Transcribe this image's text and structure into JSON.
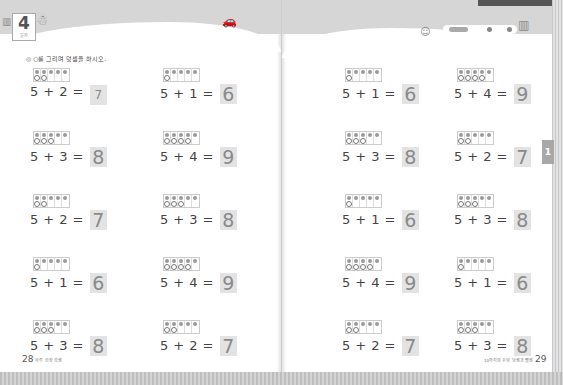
{
  "left_page": {
    "unit": {
      "number": "4",
      "label": "일차"
    },
    "instruction": {
      "icon": "◎",
      "text": "○를 그리며 덧셈을 하시오."
    },
    "problems": [
      {
        "a": "5",
        "op": "+",
        "b": "2",
        "eq": "=",
        "answer": "7",
        "filled": 5,
        "drawn": 2,
        "answer_style": "handwritten"
      },
      {
        "a": "5",
        "op": "+",
        "b": "1",
        "eq": "=",
        "answer": "6",
        "filled": 5,
        "drawn": 1
      },
      {
        "a": "5",
        "op": "+",
        "b": "3",
        "eq": "=",
        "answer": "8",
        "filled": 5,
        "drawn": 3
      },
      {
        "a": "5",
        "op": "+",
        "b": "4",
        "eq": "=",
        "answer": "9",
        "filled": 5,
        "drawn": 4
      },
      {
        "a": "5",
        "op": "+",
        "b": "2",
        "eq": "=",
        "answer": "7",
        "filled": 5,
        "drawn": 2
      },
      {
        "a": "5",
        "op": "+",
        "b": "3",
        "eq": "=",
        "answer": "8",
        "filled": 5,
        "drawn": 3
      },
      {
        "a": "5",
        "op": "+",
        "b": "1",
        "eq": "=",
        "answer": "6",
        "filled": 5,
        "drawn": 1
      },
      {
        "a": "5",
        "op": "+",
        "b": "4",
        "eq": "=",
        "answer": "9",
        "filled": 5,
        "drawn": 4
      },
      {
        "a": "5",
        "op": "+",
        "b": "3",
        "eq": "=",
        "answer": "8",
        "filled": 5,
        "drawn": 3
      },
      {
        "a": "5",
        "op": "+",
        "b": "2",
        "eq": "=",
        "answer": "7",
        "filled": 5,
        "drawn": 2
      }
    ],
    "footer": {
      "page_number": "28",
      "text": "하루 한장 쏙셈"
    }
  },
  "right_page": {
    "problems": [
      {
        "a": "5",
        "op": "+",
        "b": "1",
        "eq": "=",
        "answer": "6",
        "filled": 5,
        "drawn": 1
      },
      {
        "a": "5",
        "op": "+",
        "b": "4",
        "eq": "=",
        "answer": "9",
        "filled": 5,
        "drawn": 4
      },
      {
        "a": "5",
        "op": "+",
        "b": "3",
        "eq": "=",
        "answer": "8",
        "filled": 5,
        "drawn": 3
      },
      {
        "a": "5",
        "op": "+",
        "b": "2",
        "eq": "=",
        "answer": "7",
        "filled": 5,
        "drawn": 2
      },
      {
        "a": "5",
        "op": "+",
        "b": "1",
        "eq": "=",
        "answer": "6",
        "filled": 5,
        "drawn": 1
      },
      {
        "a": "5",
        "op": "+",
        "b": "3",
        "eq": "=",
        "answer": "8",
        "filled": 5,
        "drawn": 3
      },
      {
        "a": "5",
        "op": "+",
        "b": "4",
        "eq": "=",
        "answer": "9",
        "filled": 5,
        "drawn": 4
      },
      {
        "a": "5",
        "op": "+",
        "b": "1",
        "eq": "=",
        "answer": "6",
        "filled": 5,
        "drawn": 1
      },
      {
        "a": "5",
        "op": "+",
        "b": "2",
        "eq": "=",
        "answer": "7",
        "filled": 5,
        "drawn": 2
      },
      {
        "a": "5",
        "op": "+",
        "b": "3",
        "eq": "=",
        "answer": "8",
        "filled": 5,
        "drawn": 3
      }
    ],
    "chapter_tab": "1",
    "footer": {
      "page_number": "29",
      "text": "10까지의 수의 덧셈과 뺄셈"
    }
  }
}
